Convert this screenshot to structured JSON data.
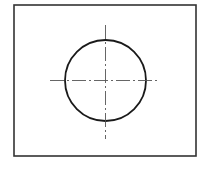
{
  "diagram": {
    "type": "technical-drawing",
    "frame": {
      "x": 14,
      "y": 5,
      "width": 182,
      "height": 151,
      "stroke": "#333333",
      "stroke_width": 1.6
    },
    "circle": {
      "cx": 105.5,
      "cy": 80.5,
      "r": 40.5,
      "stroke": "#1a1a1a",
      "stroke_width": 1.8
    },
    "center_lines": {
      "stroke": "#555555",
      "stroke_width": 0.9,
      "dash_pattern": "14,3,2,3",
      "horizontal": {
        "x1": 50,
        "y1": 80.5,
        "x2": 159,
        "y2": 80.5
      },
      "vertical": {
        "x1": 105.5,
        "y1": 25,
        "x2": 105.5,
        "y2": 139
      }
    }
  }
}
